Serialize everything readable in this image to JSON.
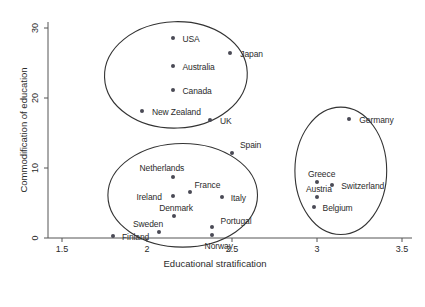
{
  "chart_data": {
    "type": "scatter",
    "title": "",
    "xlabel": "Educational stratification",
    "ylabel": "Commodification of education",
    "xlim": [
      1.4,
      3.6
    ],
    "ylim": [
      -1,
      31
    ],
    "xticks": [
      "1.5",
      "2",
      "2.5",
      "3",
      "3.5"
    ],
    "xtick_values": [
      1.5,
      2,
      2.5,
      3,
      3.5
    ],
    "yticks": [
      "0",
      "10",
      "20",
      "30"
    ],
    "ytick_values": [
      0,
      10,
      20,
      30
    ],
    "grid": false,
    "legend": "none",
    "marker_color": "#4a4a55",
    "points": [
      {
        "label": "USA",
        "x": 2.15,
        "y": 28.6,
        "lx": 10,
        "ly": -4
      },
      {
        "label": "Japan",
        "x": 2.49,
        "y": 26.5,
        "lx": 10,
        "ly": -4
      },
      {
        "label": "Australia",
        "x": 2.15,
        "y": 24.6,
        "lx": 10,
        "ly": -4
      },
      {
        "label": "Canada",
        "x": 2.15,
        "y": 21.2,
        "lx": 10,
        "ly": -4
      },
      {
        "label": "New Zealand",
        "x": 1.97,
        "y": 18.2,
        "lx": 10,
        "ly": -4
      },
      {
        "label": "UK",
        "x": 2.37,
        "y": 16.9,
        "lx": 10,
        "ly": -4
      },
      {
        "label": "Germany",
        "x": 3.19,
        "y": 17.0,
        "lx": 10,
        "ly": -4
      },
      {
        "label": "Spain",
        "x": 2.5,
        "y": 12.2,
        "lx": 8,
        "ly": -13
      },
      {
        "label": "Netherlands",
        "x": 2.15,
        "y": 8.7,
        "lx": -33,
        "ly": -14
      },
      {
        "label": "Greece",
        "x": 3.0,
        "y": 8.0,
        "lx": -9,
        "ly": -13
      },
      {
        "label": "Switzerland",
        "x": 3.09,
        "y": 7.6,
        "lx": 9,
        "ly": -4
      },
      {
        "label": "France",
        "x": 2.25,
        "y": 6.6,
        "lx": 5,
        "ly": -12
      },
      {
        "label": "Ireland",
        "x": 2.15,
        "y": 6.0,
        "lx": -36,
        "ly": -4
      },
      {
        "label": "Italy",
        "x": 2.44,
        "y": 5.9,
        "lx": 9,
        "ly": -4
      },
      {
        "label": "Austria",
        "x": 3.0,
        "y": 5.9,
        "lx": -11,
        "ly": -13
      },
      {
        "label": "Denmark",
        "x": 2.16,
        "y": 3.2,
        "lx": -15,
        "ly": -13
      },
      {
        "label": "Belgium",
        "x": 2.98,
        "y": 4.4,
        "lx": 9,
        "ly": -4
      },
      {
        "label": "Portugal",
        "x": 2.38,
        "y": 1.6,
        "lx": 9,
        "ly": -11
      },
      {
        "label": "Sweden",
        "x": 2.07,
        "y": 0.9,
        "lx": -26,
        "ly": -13
      },
      {
        "label": "Norway",
        "x": 2.38,
        "y": 0.4,
        "lx": -7,
        "ly": 6
      },
      {
        "label": "Finland",
        "x": 1.8,
        "y": 0.3,
        "lx": 9,
        "ly": -4
      }
    ],
    "clusters": [
      {
        "name": "liberal-cluster",
        "cx": 2.17,
        "cy": 23.3,
        "rx": 0.42,
        "ry": 7.6,
        "rot": -2
      },
      {
        "name": "social-democratic-cluster",
        "cx": 2.21,
        "cy": 6.1,
        "rx": 0.44,
        "ry": 7.4,
        "rot": 0
      },
      {
        "name": "conservative-cluster",
        "cx": 3.14,
        "cy": 9.6,
        "rx": 0.27,
        "ry": 9.1,
        "rot": 0
      }
    ]
  }
}
